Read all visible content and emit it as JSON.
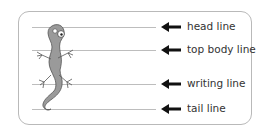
{
  "diagram": {
    "lines": [
      {
        "label": "head line",
        "y": 27
      },
      {
        "label": "top body line",
        "y": 50
      },
      {
        "label": "writing line",
        "y": 84
      },
      {
        "label": "tail line",
        "y": 109
      }
    ],
    "colors": {
      "line": "#bdbdbd",
      "frame": "#b9b9b9",
      "arrow": "#111111",
      "gecko": "#9a9a9a",
      "text": "#333333"
    }
  }
}
